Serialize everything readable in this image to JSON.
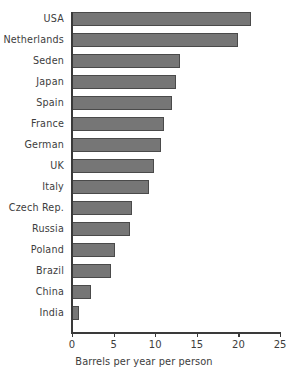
{
  "chart_data": {
    "type": "bar",
    "orientation": "horizontal",
    "title": "",
    "xlabel": "Barrels per year per person",
    "ylabel": "",
    "xlim": [
      0,
      25
    ],
    "xticks": [
      0,
      5,
      10,
      15,
      20,
      25
    ],
    "grid": false,
    "legend": null,
    "bar_color": "#767676",
    "bar_edge_color": "#4a4a4a",
    "axis_color": "#3a3a3a",
    "text_color": "#3d3d3d",
    "categories": [
      "USA",
      "Netherlands",
      "Seden",
      "Japan",
      "Spain",
      "France",
      "German",
      "UK",
      "Italy",
      "Czech Rep.",
      "Russia",
      "Poland",
      "Brazil",
      "China",
      "India"
    ],
    "values": [
      21.5,
      20.0,
      13.0,
      12.5,
      12.0,
      11.0,
      10.7,
      9.8,
      9.3,
      7.2,
      7.0,
      5.2,
      4.7,
      2.3,
      0.8
    ]
  }
}
